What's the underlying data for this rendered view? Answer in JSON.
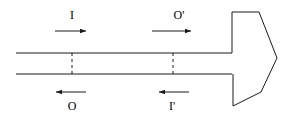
{
  "figure": {
    "canvas": {
      "width": 285,
      "height": 119,
      "background": "#ffffff"
    },
    "stroke_color": "#1a1a1a",
    "stroke_width": 1,
    "labels": [
      {
        "id": "incident-upper",
        "text": "I",
        "x": 72,
        "y": 15
      },
      {
        "id": "output-upper",
        "text": "O'",
        "x": 179,
        "y": 15
      },
      {
        "id": "output-lower",
        "text": "O",
        "x": 72,
        "y": 106
      },
      {
        "id": "incident-lower",
        "text": "I'",
        "x": 172,
        "y": 106
      }
    ],
    "arrows": [
      {
        "id": "arrow-incident-upper",
        "direction": "right",
        "x1": 55,
        "y1": 31,
        "x2": 86,
        "y2": 31
      },
      {
        "id": "arrow-output-upper",
        "direction": "right",
        "x1": 152,
        "y1": 31,
        "x2": 191,
        "y2": 31
      },
      {
        "id": "arrow-output-lower",
        "direction": "left",
        "x1": 86,
        "y1": 92,
        "x2": 56,
        "y2": 92
      },
      {
        "id": "arrow-incident-lower",
        "direction": "left",
        "x1": 189,
        "y1": 92,
        "x2": 159,
        "y2": 92
      }
    ],
    "guide_lines": [
      {
        "id": "waveguide-upper-wall",
        "x1": 16,
        "y1": 53,
        "x2": 232,
        "y2": 53
      },
      {
        "id": "waveguide-lower-wall",
        "x1": 16,
        "y1": 74,
        "x2": 232,
        "y2": 74
      }
    ],
    "reference_planes": [
      {
        "id": "reference-plane-left",
        "x": 72,
        "y1": 53,
        "y2": 74,
        "dash": "3,3"
      },
      {
        "id": "reference-plane-right",
        "x": 173,
        "y1": 53,
        "y2": 74,
        "dash": "3,3"
      }
    ],
    "horn": {
      "id": "horn-aperture-outline",
      "points": "232,53 232,12 259,12 277,58 261,92 233,106 233,74"
    }
  }
}
